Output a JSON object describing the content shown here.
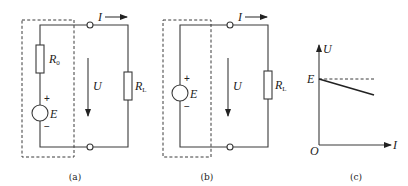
{
  "panels": [
    {
      "id": "a",
      "caption": "(a)",
      "labels": {
        "current": "I",
        "voltage": "U",
        "internal_resistor": "R",
        "internal_resistor_sub": "0",
        "load_resistor": "R",
        "load_resistor_sub": "L",
        "source": "E",
        "plus": "+",
        "minus": "−"
      }
    },
    {
      "id": "b",
      "caption": "(b)",
      "labels": {
        "current": "I",
        "voltage": "U",
        "load_resistor": "R",
        "load_resistor_sub": "L",
        "source": "E",
        "plus": "+",
        "minus": "−"
      }
    },
    {
      "id": "c",
      "caption": "(c)",
      "labels": {
        "y_axis": "U",
        "x_axis": "I",
        "origin": "O",
        "intercept": "E"
      }
    }
  ],
  "colors": {
    "stroke": "#3a3a3a",
    "text": "#222222",
    "background": "#ffffff"
  }
}
